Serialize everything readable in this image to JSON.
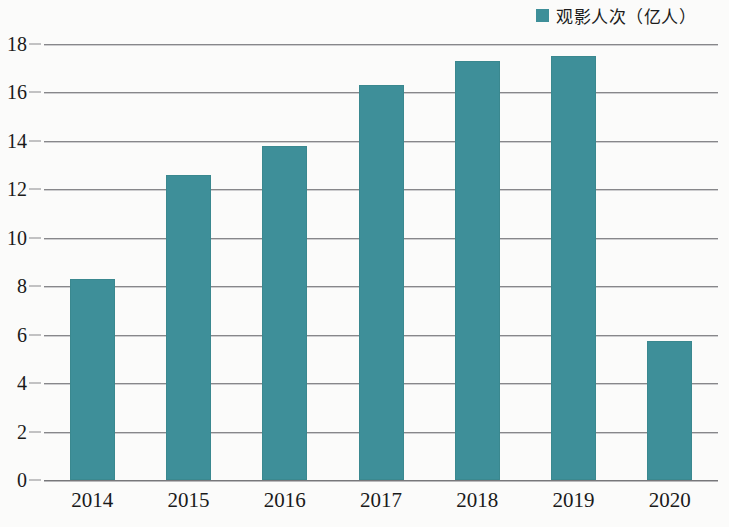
{
  "legend": {
    "marker": "legend-color-swatch",
    "label": "观影人次（亿人）",
    "color": "#3e8f99"
  },
  "axes": {
    "y_ticks": [
      "0",
      "2",
      "4",
      "6",
      "8",
      "10",
      "12",
      "14",
      "16",
      "18"
    ],
    "x_ticks": [
      "2014",
      "2015",
      "2016",
      "2017",
      "2018",
      "2019",
      "2020"
    ]
  },
  "chart_data": {
    "type": "bar",
    "title": "",
    "subtitle": "",
    "xlabel": "",
    "ylabel": "",
    "categories": [
      "2014",
      "2015",
      "2016",
      "2017",
      "2018",
      "2019",
      "2020"
    ],
    "values": [
      8.3,
      12.6,
      13.8,
      16.3,
      17.3,
      17.5,
      5.75
    ],
    "series": [
      {
        "name": "观影人次（亿人）",
        "values": [
          8.3,
          12.6,
          13.8,
          16.3,
          17.3,
          17.5,
          5.75
        ],
        "color": "#3e8f99"
      }
    ],
    "ylim": [
      0,
      18
    ],
    "ytick_step": 2,
    "grid": "horizontal",
    "legend_position": "top-right",
    "bar_color": "#3e8f99",
    "unit": "亿人"
  }
}
